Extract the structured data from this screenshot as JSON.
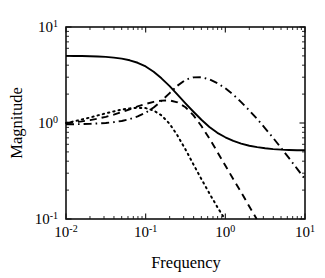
{
  "chart_data": {
    "type": "line",
    "title": "",
    "subtitle": "",
    "xlabel": "Frequency",
    "ylabel": "Magnitude",
    "xscale": "log",
    "yscale": "log",
    "xlim": [
      0.01,
      10
    ],
    "ylim": [
      0.1,
      10
    ],
    "grid": false,
    "legend": "none",
    "xticks": [
      {
        "value": 0.01,
        "mantissa": "10",
        "exponent": "-2",
        "label": "10^-2"
      },
      {
        "value": 0.1,
        "mantissa": "10",
        "exponent": "-1",
        "label": "10^-1"
      },
      {
        "value": 1,
        "mantissa": "10",
        "exponent": "0",
        "label": "10^0"
      },
      {
        "value": 10,
        "mantissa": "10",
        "exponent": "1",
        "label": "10^1"
      }
    ],
    "yticks": [
      {
        "value": 0.1,
        "mantissa": "10",
        "exponent": "-1",
        "label": "10^-1"
      },
      {
        "value": 1,
        "mantissa": "10",
        "exponent": "0",
        "label": "10^0"
      },
      {
        "value": 10,
        "mantissa": "10",
        "exponent": "1",
        "label": "10^1"
      }
    ],
    "series": [
      {
        "name": "solid-curve",
        "style": "solid",
        "color": "#000000",
        "x": [
          0.01,
          0.0126,
          0.0158,
          0.02,
          0.0251,
          0.0316,
          0.0398,
          0.0501,
          0.0631,
          0.0794,
          0.1,
          0.126,
          0.158,
          0.2,
          0.251,
          0.316,
          0.398,
          0.501,
          0.631,
          0.794,
          1.0,
          1.26,
          1.58,
          2.0,
          2.51,
          3.16,
          3.98,
          5.01,
          6.31,
          7.94,
          10.0
        ],
        "y": [
          5.0,
          4.99,
          4.98,
          4.96,
          4.93,
          4.88,
          4.8,
          4.68,
          4.5,
          4.24,
          3.88,
          3.42,
          2.92,
          2.42,
          1.97,
          1.6,
          1.31,
          1.08,
          0.91,
          0.79,
          0.71,
          0.65,
          0.61,
          0.58,
          0.56,
          0.545,
          0.535,
          0.528,
          0.524,
          0.521,
          0.52
        ]
      },
      {
        "name": "dashed-curve",
        "style": "dashed",
        "color": "#000000",
        "x": [
          0.01,
          0.0126,
          0.0158,
          0.02,
          0.0251,
          0.0316,
          0.0398,
          0.0501,
          0.0631,
          0.0794,
          0.1,
          0.126,
          0.158,
          0.2,
          0.251,
          0.316,
          0.398,
          0.501,
          0.631,
          0.794,
          1.0,
          1.26,
          1.58,
          2.0,
          2.51,
          3.16,
          3.98,
          5.01,
          6.31
        ],
        "y": [
          1.0,
          1.02,
          1.04,
          1.07,
          1.11,
          1.16,
          1.22,
          1.3,
          1.39,
          1.49,
          1.58,
          1.66,
          1.71,
          1.72,
          1.64,
          1.46,
          1.2,
          0.93,
          0.69,
          0.5,
          0.36,
          0.26,
          0.19,
          0.135,
          0.098,
          0.0705,
          0.051,
          0.037,
          0.0275
        ]
      },
      {
        "name": "dotted-curve",
        "style": "dotted",
        "color": "#000000",
        "x": [
          0.01,
          0.0126,
          0.0158,
          0.02,
          0.0251,
          0.0316,
          0.0398,
          0.0501,
          0.0631,
          0.0794,
          0.1,
          0.126,
          0.158,
          0.2,
          0.251,
          0.316,
          0.398,
          0.501,
          0.631,
          0.794,
          1.0,
          1.26,
          1.41
        ],
        "y": [
          1.0,
          1.04,
          1.09,
          1.14,
          1.2,
          1.26,
          1.32,
          1.38,
          1.42,
          1.44,
          1.43,
          1.35,
          1.2,
          0.98,
          0.74,
          0.53,
          0.37,
          0.26,
          0.185,
          0.133,
          0.098,
          0.076,
          0.068
        ]
      },
      {
        "name": "dash-dot-curve",
        "style": "dashdot",
        "color": "#000000",
        "x": [
          0.01,
          0.0126,
          0.0158,
          0.02,
          0.0251,
          0.0316,
          0.0398,
          0.0501,
          0.0631,
          0.0794,
          0.1,
          0.126,
          0.158,
          0.2,
          0.251,
          0.316,
          0.398,
          0.501,
          0.631,
          0.794,
          1.0,
          1.26,
          1.58,
          2.0,
          2.51,
          3.16,
          3.98,
          5.01,
          6.31,
          7.94,
          10.0
        ],
        "y": [
          0.97,
          0.97,
          0.975,
          0.98,
          0.99,
          1.0,
          1.02,
          1.05,
          1.1,
          1.17,
          1.28,
          1.45,
          1.7,
          2.05,
          2.45,
          2.82,
          2.99,
          3.0,
          2.85,
          2.6,
          2.3,
          1.97,
          1.65,
          1.35,
          1.1,
          0.88,
          0.7,
          0.55,
          0.43,
          0.335,
          0.26
        ]
      }
    ]
  }
}
